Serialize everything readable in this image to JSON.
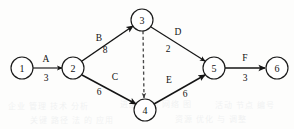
{
  "diagram": {
    "type": "aoa-network",
    "width": 294,
    "height": 129,
    "colors": {
      "node_stroke": "#1a1a1a",
      "node_fill": "#ffffff",
      "edge": "#151515",
      "dummy_edge": "#4a4a4a",
      "text": "#111111",
      "background": "#fdfdfc"
    },
    "nodes": [
      {
        "id": "1",
        "label": "1",
        "cx": 22,
        "cy": 68,
        "r": 11
      },
      {
        "id": "2",
        "label": "2",
        "cx": 73,
        "cy": 68,
        "r": 11
      },
      {
        "id": "3",
        "label": "3",
        "cx": 142,
        "cy": 20,
        "r": 11
      },
      {
        "id": "4",
        "label": "4",
        "cx": 145,
        "cy": 110,
        "r": 11
      },
      {
        "id": "5",
        "label": "5",
        "cx": 214,
        "cy": 68,
        "r": 11
      },
      {
        "id": "6",
        "label": "6",
        "cx": 277,
        "cy": 68,
        "r": 11
      }
    ],
    "edges": [
      {
        "id": "A",
        "name": "A",
        "duration": "3",
        "from": "1",
        "to": "2",
        "dummy": false,
        "x1": 33,
        "y1": 68,
        "x2": 62,
        "y2": 68,
        "name_x": 46,
        "name_y": 59,
        "dur_x": 46,
        "dur_y": 78
      },
      {
        "id": "B",
        "name": "B",
        "duration": "8",
        "from": "2",
        "to": "3",
        "dummy": false,
        "x1": 82,
        "y1": 61,
        "x2": 133,
        "y2": 26,
        "name_x": 99,
        "name_y": 38,
        "dur_x": 105,
        "dur_y": 50
      },
      {
        "id": "C",
        "name": "C",
        "duration": "6",
        "from": "2",
        "to": "4",
        "dummy": false,
        "x1": 82,
        "y1": 75,
        "x2": 136,
        "y2": 104,
        "name_x": 115,
        "name_y": 77,
        "dur_x": 99,
        "dur_y": 92
      },
      {
        "id": "D",
        "name": "D",
        "duration": "2",
        "from": "3",
        "to": "5",
        "dummy": false,
        "x1": 151,
        "y1": 27,
        "x2": 205,
        "y2": 61,
        "name_x": 178,
        "name_y": 32,
        "dur_x": 168,
        "dur_y": 49
      },
      {
        "id": "E",
        "name": "E",
        "duration": "6",
        "from": "4",
        "to": "5",
        "dummy": false,
        "x1": 154,
        "y1": 104,
        "x2": 205,
        "y2": 75,
        "name_x": 169,
        "name_y": 80,
        "dur_x": 185,
        "dur_y": 94
      },
      {
        "id": "F",
        "name": "F",
        "duration": "3",
        "from": "5",
        "to": "6",
        "dummy": false,
        "x1": 225,
        "y1": 68,
        "x2": 265,
        "y2": 68,
        "name_x": 245,
        "name_y": 58,
        "dur_x": 245,
        "dur_y": 78
      },
      {
        "id": "dummy",
        "name": "",
        "duration": "",
        "from": "3",
        "to": "4",
        "dummy": true,
        "x1": 143,
        "y1": 31,
        "x2": 144,
        "y2": 98,
        "name_x": 0,
        "name_y": 0,
        "dur_x": 0,
        "dur_y": 0
      }
    ],
    "background_bleed": [
      {
        "text": "企业 管理 技术 分析",
        "x": 8,
        "y": 100
      },
      {
        "text": "进度 计划 网络 图",
        "x": 120,
        "y": 98
      },
      {
        "text": "关键 路径 法 的 应用",
        "x": 30,
        "y": 114
      },
      {
        "text": "资源 优化 与 调整",
        "x": 175,
        "y": 113
      },
      {
        "text": "活动 节点 编号",
        "x": 215,
        "y": 99
      }
    ]
  }
}
